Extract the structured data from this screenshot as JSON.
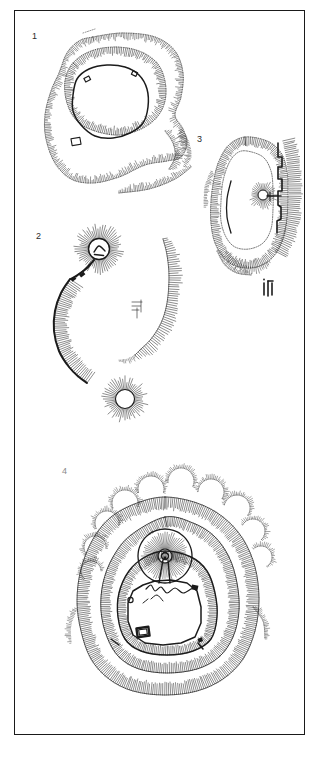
{
  "page": {
    "type": "archaeological-plan-plate",
    "background_color": "#ffffff",
    "frame_color": "#1a1a1a",
    "ink_color": "#1b1b1b",
    "width": 316,
    "height": 759
  },
  "plans": [
    {
      "label": "1",
      "kind": "hillfort-with-inner-ringwork",
      "description": "Large irregular contour-hachured hillfort enclosure with an inner oval ringwork and small rectangular structures on its bank"
    },
    {
      "label": "2",
      "kind": "motte-and-bailey",
      "description": "Circular motte with radiating hachures, linked stone wall running south-west, detached bailey bank to the east and a second smaller motte to the south"
    },
    {
      "label": "3",
      "kind": "promontory-enclosure-with-curtain-wall",
      "description": "Sub-oval hachured enclosure with a buttressed stone curtain wall on the east side, a small circular mound and an internal building block"
    },
    {
      "label": "4",
      "kind": "motte-and-bailey-with-multiple-ramparts",
      "description": "Concentric multivallate earthwork with a central motte bearing a keep, a polygonal bailey with curtain wall, gatehouse block and surrounding ditches"
    }
  ],
  "labels": {
    "plan1": "1",
    "plan2": "2",
    "plan3": "3",
    "plan4": "4"
  }
}
